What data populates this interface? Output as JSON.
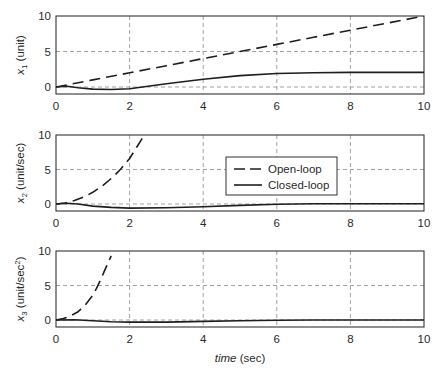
{
  "chart_data": [
    {
      "type": "line",
      "panel": 1,
      "title": "",
      "xlabel": "",
      "ylabel": "x1 (unit)",
      "ylabel_main": "x",
      "ylabel_sub": "1",
      "ylabel_rest": " (unit)",
      "xlim": [
        0,
        10
      ],
      "ylim": [
        -1,
        10
      ],
      "xticks": [
        0,
        2,
        4,
        6,
        8,
        10
      ],
      "yticks": [
        0,
        5,
        10
      ],
      "grid": true,
      "series": [
        {
          "name": "Open-loop",
          "style": "dashed",
          "x": [
            0,
            1,
            2,
            3,
            4,
            5,
            6,
            7,
            8,
            9,
            10
          ],
          "y": [
            0,
            1,
            2,
            3,
            4,
            5,
            6,
            7,
            8,
            9,
            10
          ]
        },
        {
          "name": "Closed-loop",
          "style": "solid",
          "x": [
            0,
            0.3,
            0.6,
            1,
            1.5,
            2,
            2.5,
            3,
            4,
            5,
            6,
            7,
            8,
            9,
            10
          ],
          "y": [
            0,
            0.1,
            -0.1,
            -0.3,
            -0.35,
            -0.25,
            0.1,
            0.45,
            1.1,
            1.6,
            1.9,
            2.0,
            2.05,
            2.05,
            2.05
          ]
        }
      ]
    },
    {
      "type": "line",
      "panel": 2,
      "xlabel": "",
      "ylabel": "x2 (unit/sec)",
      "ylabel_main": "x",
      "ylabel_sub": "2",
      "ylabel_rest": " (unit/sec)",
      "xlim": [
        0,
        10
      ],
      "ylim": [
        -1,
        10
      ],
      "xticks": [
        0,
        2,
        4,
        6,
        8,
        10
      ],
      "yticks": [
        0,
        5,
        10
      ],
      "grid": true,
      "legend": {
        "position": "center-right",
        "entries": [
          "Open-loop",
          "Closed-loop"
        ]
      },
      "series": [
        {
          "name": "Open-loop",
          "style": "dashed",
          "x": [
            0,
            0.25,
            0.5,
            0.75,
            1.0,
            1.25,
            1.5,
            1.75,
            2.0,
            2.2,
            2.4
          ],
          "y": [
            0,
            0.15,
            0.5,
            1.0,
            1.7,
            2.6,
            3.7,
            5.0,
            6.6,
            8.3,
            10
          ]
        },
        {
          "name": "Closed-loop",
          "style": "solid",
          "x": [
            0,
            0.3,
            0.6,
            1,
            1.5,
            2,
            3,
            4,
            5,
            6,
            7,
            8,
            9,
            10
          ],
          "y": [
            0,
            0.1,
            0.0,
            -0.3,
            -0.5,
            -0.6,
            -0.55,
            -0.4,
            -0.2,
            -0.05,
            0.05,
            0.05,
            0.05,
            0.05
          ]
        }
      ]
    },
    {
      "type": "line",
      "panel": 3,
      "xlabel": "time (sec)",
      "xlabel_italic": "time",
      "xlabel_rest": " (sec)",
      "ylabel": "x3 (unit/sec^2)",
      "ylabel_main": "x",
      "ylabel_sub": "3",
      "ylabel_rest": " (unit/sec",
      "ylabel_sup": "2",
      "ylabel_close": ")",
      "xlim": [
        0,
        10
      ],
      "ylim": [
        -1,
        10
      ],
      "xticks": [
        0,
        2,
        4,
        6,
        8,
        10
      ],
      "yticks": [
        0,
        5,
        10
      ],
      "grid": true,
      "series": [
        {
          "name": "Open-loop",
          "style": "dashed",
          "x": [
            0,
            0.2,
            0.4,
            0.6,
            0.8,
            1.0,
            1.1,
            1.2,
            1.3,
            1.4,
            1.5
          ],
          "y": [
            0,
            0.2,
            0.6,
            1.2,
            2.2,
            3.6,
            4.6,
            5.7,
            6.9,
            8.1,
            9.3
          ]
        },
        {
          "name": "Closed-loop",
          "style": "solid",
          "x": [
            0,
            0.5,
            1,
            1.5,
            2,
            3,
            4,
            5,
            6,
            7,
            8,
            9,
            10
          ],
          "y": [
            0,
            0.05,
            -0.1,
            -0.25,
            -0.3,
            -0.3,
            -0.2,
            -0.1,
            -0.05,
            0.0,
            0.0,
            0.0,
            0.0
          ]
        }
      ]
    }
  ],
  "legend": {
    "open_loop_label": "Open-loop",
    "closed_loop_label": "Closed-loop"
  },
  "xlabel": {
    "italic": "time",
    "rest": " (sec)"
  },
  "colors": {
    "line": "#1e1e1e",
    "grid": "#8a8a8a",
    "axes": "#333333"
  }
}
